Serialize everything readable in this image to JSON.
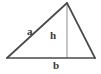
{
  "figure": {
    "type": "geometry-diagram",
    "background_color": "#ffffff",
    "width": 101,
    "height": 74,
    "outline_color": "#4a4a4a",
    "height_line_color": "#b8b8b8",
    "label_color": "#3a3a3a",
    "vertices": {
      "apex": {
        "x": 67,
        "y": 3
      },
      "bottom_left": {
        "x": 7,
        "y": 58
      },
      "bottom_right": {
        "x": 95,
        "y": 58
      },
      "foot_of_height": {
        "x": 67,
        "y": 58
      }
    },
    "labels": {
      "side_a": "a",
      "height_h": "h",
      "base_b": "b"
    }
  }
}
